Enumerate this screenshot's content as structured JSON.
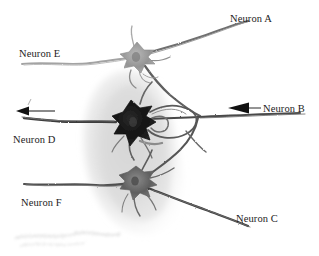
{
  "figure": {
    "kind": "neuron-micrograph-diagram",
    "background_color": "#ffffff",
    "label_color": "#1c1c1c",
    "tissue_blob_color": "#e2e2e2",
    "dark_soma_color": "#1a1a1a",
    "mid_soma_color": "#6e6e6e",
    "light_soma_color": "#9a9a9a",
    "process_color": "#5d5d5d",
    "faint_process_color": "#a6a6a6",
    "arrow_color": "#111111"
  },
  "labels": {
    "neuron_a": "Neuron A",
    "neuron_b": "Neuron B",
    "neuron_c": "Neuron C",
    "neuron_d": "Neuron D",
    "neuron_e": "Neuron E",
    "neuron_f": "Neuron F"
  },
  "cells": [
    {
      "id": "upper-soma",
      "label_refs": [
        "Neuron E",
        "Neuron A"
      ],
      "cx": 137,
      "cy": 57,
      "tone": "light"
    },
    {
      "id": "middle-soma",
      "label_refs": [
        "Neuron D"
      ],
      "cx": 132,
      "cy": 122,
      "tone": "dark"
    },
    {
      "id": "lower-soma",
      "label_refs": [
        "Neuron F",
        "Neuron C"
      ],
      "cx": 136,
      "cy": 182,
      "tone": "mid"
    }
  ],
  "arrows": [
    {
      "id": "outgoing-arrow-left",
      "points_to": "left",
      "x_tip": 16,
      "y": 111,
      "associated_label": "Neuron D"
    },
    {
      "id": "incoming-arrow-b",
      "points_to": "left",
      "x_tip": 228,
      "y": 108,
      "associated_label": "Neuron B"
    }
  ],
  "annotation_leaders": [
    {
      "id": "leader-b",
      "from_x": 249,
      "to_x": 260,
      "y": 108
    }
  ]
}
